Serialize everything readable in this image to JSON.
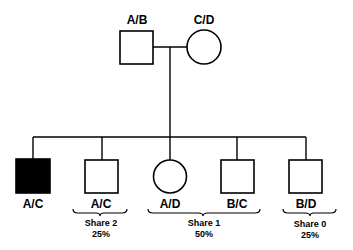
{
  "diagram": {
    "type": "pedigree",
    "colors": {
      "stroke": "#000000",
      "affected_fill": "#000000",
      "unaffected_fill": "#ffffff"
    },
    "parents": [
      {
        "sex": "male",
        "genotype": "A/B",
        "affected": false
      },
      {
        "sex": "female",
        "genotype": "C/D",
        "affected": false
      }
    ],
    "children": [
      {
        "sex": "male",
        "genotype": "A/C",
        "affected": true
      },
      {
        "sex": "male",
        "genotype": "A/C",
        "affected": false
      },
      {
        "sex": "female",
        "genotype": "A/D",
        "affected": false
      },
      {
        "sex": "male",
        "genotype": "B/C",
        "affected": false
      },
      {
        "sex": "male",
        "genotype": "B/D",
        "affected": false
      }
    ],
    "groups": [
      {
        "label": "Share 2",
        "percent": "25%"
      },
      {
        "label": "Share 1",
        "percent": "50%"
      },
      {
        "label": "Share 0",
        "percent": "25%"
      }
    ]
  }
}
